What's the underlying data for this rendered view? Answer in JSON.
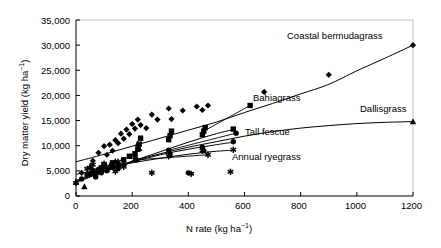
{
  "chart_data": {
    "type": "scatter",
    "title": "",
    "xlabel": "N rate (kg ha⁻¹)",
    "ylabel": "Dry matter yield (kg ha⁻¹)",
    "xlim": [
      0,
      1200
    ],
    "ylim": [
      0,
      35000
    ],
    "xticks": [
      0,
      200,
      400,
      600,
      800,
      1000,
      1200
    ],
    "xticklabels": [
      "0",
      "200",
      "400",
      "600",
      "800",
      "1000",
      "1200"
    ],
    "yticks": [
      0,
      5000,
      10000,
      15000,
      20000,
      25000,
      30000,
      35000
    ],
    "yticklabels": [
      "0",
      "5,000",
      "10,000",
      "15,000",
      "20,000",
      "25,000",
      "30,000",
      "35,000"
    ],
    "grid": false,
    "legend_position": "inline-labels",
    "series": [
      {
        "name": "Coastal bermudagrass",
        "marker": "diamond",
        "label_x": 760,
        "label_y": 31500,
        "fit_points": [
          [
            0,
            6800
          ],
          [
            100,
            8300
          ],
          [
            200,
            9900
          ],
          [
            300,
            11500
          ],
          [
            400,
            13100
          ],
          [
            500,
            14700
          ],
          [
            600,
            16600
          ],
          [
            700,
            18400
          ],
          [
            800,
            20300
          ],
          [
            900,
            22200
          ],
          [
            1000,
            24900
          ],
          [
            1100,
            27400
          ],
          [
            1200,
            30000
          ]
        ],
        "points": [
          [
            20,
            4600
          ],
          [
            60,
            7000
          ],
          [
            80,
            8600
          ],
          [
            100,
            9900
          ],
          [
            110,
            8200
          ],
          [
            120,
            10200
          ],
          [
            130,
            9000
          ],
          [
            140,
            11100
          ],
          [
            150,
            10500
          ],
          [
            160,
            12400
          ],
          [
            170,
            11400
          ],
          [
            180,
            13200
          ],
          [
            190,
            12300
          ],
          [
            200,
            14300
          ],
          [
            210,
            13400
          ],
          [
            220,
            15200
          ],
          [
            230,
            14100
          ],
          [
            250,
            13500
          ],
          [
            270,
            16200
          ],
          [
            290,
            15200
          ],
          [
            330,
            17400
          ],
          [
            340,
            15300
          ],
          [
            380,
            17000
          ],
          [
            430,
            17800
          ],
          [
            450,
            17100
          ],
          [
            470,
            18000
          ],
          [
            670,
            20700
          ],
          [
            900,
            24100
          ],
          [
            1200,
            30000
          ]
        ]
      },
      {
        "name": "Bahiagrass",
        "marker": "square",
        "label_x": 620,
        "label_y": 18000,
        "fit_points": [
          [
            0,
            2900
          ],
          [
            100,
            4900
          ],
          [
            200,
            6900
          ],
          [
            300,
            8800
          ],
          [
            400,
            10700
          ],
          [
            500,
            12400
          ],
          [
            560,
            13200
          ]
        ],
        "points": [
          [
            40,
            4200
          ],
          [
            60,
            5000
          ],
          [
            70,
            4400
          ],
          [
            90,
            5600
          ],
          [
            100,
            6200
          ],
          [
            110,
            5300
          ],
          [
            130,
            6600
          ],
          [
            150,
            6000
          ],
          [
            170,
            7200
          ],
          [
            190,
            7900
          ],
          [
            210,
            8400
          ],
          [
            220,
            9300
          ],
          [
            225,
            10300
          ],
          [
            230,
            11500
          ],
          [
            330,
            11200
          ],
          [
            335,
            12000
          ],
          [
            340,
            12900
          ],
          [
            450,
            12200
          ],
          [
            455,
            12900
          ],
          [
            460,
            13600
          ],
          [
            560,
            13300
          ]
        ]
      },
      {
        "name": "Dallisgrass",
        "marker": "triangle",
        "label_x": 840,
        "label_y": 17200,
        "fit_points": [
          [
            0,
            3100
          ],
          [
            100,
            5100
          ],
          [
            200,
            6900
          ],
          [
            300,
            8400
          ],
          [
            400,
            9700
          ],
          [
            500,
            10800
          ],
          [
            600,
            11900
          ],
          [
            700,
            12800
          ],
          [
            800,
            13500
          ],
          [
            900,
            14000
          ],
          [
            1000,
            14400
          ],
          [
            1100,
            14650
          ],
          [
            1200,
            14800
          ]
        ],
        "points": [
          [
            0,
            2800
          ],
          [
            30,
            1900
          ],
          [
            50,
            5900
          ],
          [
            60,
            4800
          ],
          [
            80,
            5200
          ],
          [
            100,
            6300
          ],
          [
            120,
            6000
          ],
          [
            140,
            6900
          ],
          [
            220,
            10400
          ],
          [
            225,
            9500
          ],
          [
            1200,
            14800
          ]
        ]
      },
      {
        "name": "Tall fescue",
        "marker": "circle",
        "label_x": 570,
        "label_y": 12500,
        "fit_points": [
          [
            0,
            2700
          ],
          [
            100,
            4800
          ],
          [
            200,
            6700
          ],
          [
            300,
            8200
          ],
          [
            400,
            9300
          ],
          [
            500,
            10200
          ],
          [
            560,
            10700
          ]
        ],
        "points": [
          [
            20,
            3400
          ],
          [
            50,
            4300
          ],
          [
            70,
            3800
          ],
          [
            80,
            5300
          ],
          [
            90,
            4600
          ],
          [
            110,
            5000
          ],
          [
            130,
            5700
          ],
          [
            150,
            5400
          ],
          [
            170,
            6200
          ],
          [
            210,
            8100
          ],
          [
            215,
            7200
          ],
          [
            330,
            9100
          ],
          [
            335,
            8300
          ],
          [
            400,
            4600
          ],
          [
            450,
            9700
          ],
          [
            455,
            9000
          ],
          [
            560,
            10800
          ]
        ]
      },
      {
        "name": "Annual ryegrass",
        "marker": "asterisk",
        "label_x": 470,
        "label_y": 8200,
        "fit_points": [
          [
            0,
            4300
          ],
          [
            100,
            5500
          ],
          [
            200,
            6600
          ],
          [
            300,
            7500
          ],
          [
            400,
            8300
          ],
          [
            500,
            8900
          ],
          [
            560,
            9100
          ]
        ],
        "points": [
          [
            0,
            2600
          ],
          [
            40,
            5400
          ],
          [
            60,
            6200
          ],
          [
            80,
            5100
          ],
          [
            100,
            6400
          ],
          [
            110,
            5700
          ],
          [
            130,
            6300
          ],
          [
            140,
            4900
          ],
          [
            150,
            6800
          ],
          [
            170,
            5800
          ],
          [
            210,
            7300
          ],
          [
            270,
            4600
          ],
          [
            330,
            7900
          ],
          [
            410,
            4400
          ],
          [
            450,
            9000
          ],
          [
            550,
            4800
          ],
          [
            560,
            9200
          ]
        ]
      }
    ]
  },
  "axes": {
    "x_title": "N rate (kg ha",
    "x_title_sup": "−1",
    "x_title_end": ")",
    "y_title": "Dry matter yield (kg ha",
    "y_title_sup": "−1",
    "y_title_end": ")"
  },
  "labels": {
    "bermudagrass": "Coastal bermudagrass",
    "bahiagrass": "Bahiagrass",
    "dallisgrass": "Dallisgrass",
    "tall_fescue": "Tall fescue",
    "annual_ryegrass": "Annual ryegrass"
  },
  "yticks": {
    "t0": "0",
    "t1": "5,000",
    "t2": "10,000",
    "t3": "15,000",
    "t4": "20,000",
    "t5": "25,000",
    "t6": "30,000",
    "t7": "35,000"
  },
  "xticks": {
    "t0": "0",
    "t1": "200",
    "t2": "400",
    "t3": "600",
    "t4": "800",
    "t5": "1000",
    "t6": "1200"
  },
  "colors": {
    "axis": "#000000",
    "marker": "#000000",
    "line": "#000000",
    "background": "#ffffff"
  }
}
